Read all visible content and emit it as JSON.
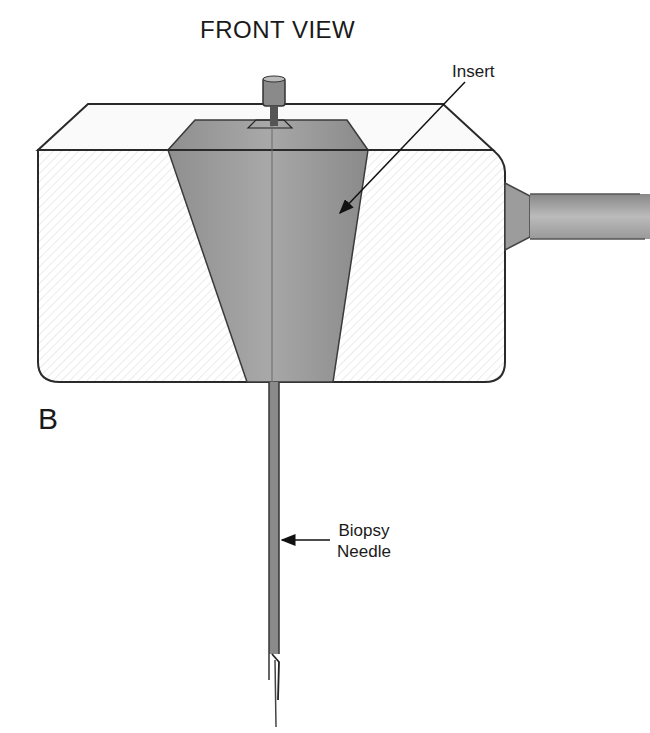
{
  "figure": {
    "title": "FRONT VIEW",
    "panel_letter": "B",
    "labels": {
      "insert": "Insert",
      "needle_line1": "Biopsy",
      "needle_line2": "Needle"
    },
    "colors": {
      "outline": "#2a2a2a",
      "insert_fill": "#9a9a9a",
      "block_fill": "#f4f4f4",
      "needle": "#555555"
    }
  }
}
